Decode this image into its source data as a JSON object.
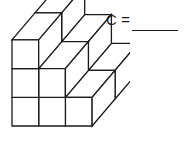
{
  "worksheet": {
    "figure": {
      "name": "cube-stack-staircase",
      "description": "Isometric staircase stack of unit cubes",
      "line_color": "#1a1a1a",
      "face_color": "#ffffff",
      "stroke_width": 1.3,
      "cube_count": 12,
      "front_columns_heights": [
        3,
        2,
        1
      ],
      "depth_rows": 2,
      "unit_width": 26.7,
      "unit_height": 28.7,
      "depth_dx": 23,
      "depth_dy": -27,
      "origin_x": 12,
      "origin_y": 126
    },
    "answer": {
      "label": "C",
      "equals": "=",
      "blank_value": ""
    }
  }
}
